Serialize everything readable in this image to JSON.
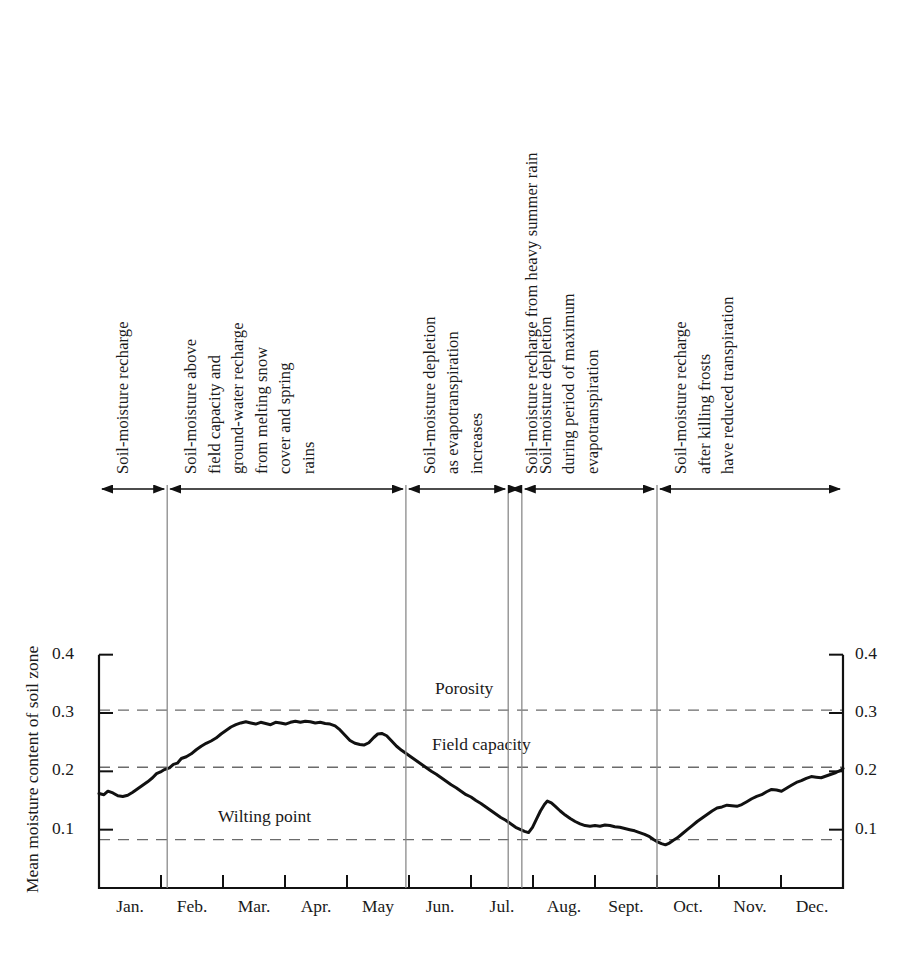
{
  "figure": {
    "background_color": "#ffffff",
    "line_color": "#111111",
    "dashed_color": "#6b6b6b",
    "divider_color": "#8a8a8a"
  },
  "axes": {
    "y_axis_title": "Mean moisture content of soil zone",
    "y_ticks": [
      "0.4",
      "0.3",
      "0.2",
      "0.1"
    ],
    "y_tick_values": [
      0.4,
      0.3,
      0.2,
      0.1
    ],
    "y_ticks_right": [
      "0.4",
      "0.3",
      "0.2",
      "0.1"
    ],
    "y_min": 0.0,
    "y_max": 0.42,
    "x_ticks": [
      "Jan.",
      "Feb.",
      "Mar.",
      "Apr.",
      "May",
      "Jun.",
      "Jul.",
      "Aug.",
      "Sept.",
      "Oct.",
      "Nov.",
      "Dec."
    ]
  },
  "reference_lines": [
    {
      "id": "porosity",
      "label": "Porosity",
      "value": 0.305
    },
    {
      "id": "field-capacity",
      "label": "Field capacity",
      "value": 0.207
    },
    {
      "id": "wilting-point",
      "label": "Wilting point",
      "value": 0.083
    }
  ],
  "annotations": [
    {
      "id": "recharge-winter",
      "lines": [
        "Soil-moisture recharge"
      ],
      "start_month": 0.0,
      "end_month": 1.1
    },
    {
      "id": "above-field-capacity",
      "lines": [
        "Soil-moisture above",
        "field capacity and",
        "ground-water recharge",
        "from melting snow",
        "cover and spring",
        "rains"
      ],
      "start_month": 1.1,
      "end_month": 4.95
    },
    {
      "id": "depletion-evapotranspiration",
      "lines": [
        "Soil-moisture depletion",
        "as evapotranspiration",
        "increases"
      ],
      "start_month": 4.95,
      "end_month": 6.6
    },
    {
      "id": "recharge-summer-rain",
      "lines": [
        "Soil-moisture recharge from heavy summer rain"
      ],
      "start_month": 6.6,
      "end_month": 6.82
    },
    {
      "id": "depletion-max-evapotranspiration",
      "lines": [
        "Soil-moisture depletion",
        "during period of maximum",
        "evapotranspiration"
      ],
      "start_month": 6.82,
      "end_month": 9.0
    },
    {
      "id": "recharge-after-frost",
      "lines": [
        "Soil-moisture recharge",
        "after killing frosts",
        "have reduced transpiration"
      ],
      "start_month": 9.0,
      "end_month": 12.0
    }
  ],
  "chart_data": {
    "type": "line",
    "title": "",
    "xlabel": "",
    "ylabel": "Mean moisture content of soil zone",
    "ylim": [
      0.0,
      0.42
    ],
    "xlim": [
      0,
      12
    ],
    "grid": false,
    "legend": "none",
    "categories": [
      "Jan.",
      "Feb.",
      "Mar.",
      "Apr.",
      "May",
      "Jun.",
      "Jul.",
      "Aug.",
      "Sept.",
      "Oct.",
      "Nov.",
      "Dec."
    ],
    "reference_values": {
      "porosity": 0.305,
      "field_capacity": 0.207,
      "wilting_point": 0.083
    },
    "series": [
      {
        "name": "Mean moisture content of soil zone",
        "x": [
          0.0,
          0.12,
          0.24,
          0.36,
          0.48,
          0.6,
          0.72,
          0.84,
          0.96,
          1.08,
          1.2,
          1.32,
          1.44,
          1.56,
          1.68,
          1.8,
          1.92,
          2.04,
          2.16,
          2.28,
          2.4,
          2.52,
          2.64,
          2.76,
          2.88,
          3.0,
          3.12,
          3.24,
          3.36,
          3.48,
          3.6,
          3.72,
          3.84,
          3.96,
          4.08,
          4.2,
          4.32,
          4.44,
          4.56,
          4.68,
          4.8,
          4.92,
          5.04,
          5.16,
          5.28,
          5.4,
          5.52,
          5.64,
          5.76,
          5.88,
          6.0,
          6.12,
          6.24,
          6.36,
          6.48,
          6.55,
          6.62,
          6.75,
          6.9,
          7.0,
          7.12,
          7.24,
          7.36,
          7.48,
          7.6,
          7.72,
          7.84,
          7.96,
          8.08,
          8.2,
          8.32,
          8.44,
          8.56,
          8.68,
          8.8,
          8.92,
          9.0,
          9.1,
          9.22,
          9.34,
          9.46,
          9.58,
          9.7,
          9.82,
          9.94,
          10.06,
          10.18,
          10.3,
          10.42,
          10.54,
          10.66,
          10.78,
          10.9,
          11.02,
          11.14,
          11.26,
          11.38,
          11.5,
          11.62,
          11.74,
          11.86,
          12.0
        ],
        "values": [
          0.162,
          0.16,
          0.166,
          0.162,
          0.158,
          0.157,
          0.16,
          0.166,
          0.172,
          0.178,
          0.185,
          0.191,
          0.196,
          0.2,
          0.205,
          0.207,
          0.212,
          0.213,
          0.222,
          0.226,
          0.23,
          0.237,
          0.243,
          0.247,
          0.252,
          0.257,
          0.264,
          0.27,
          0.275,
          0.279,
          0.282,
          0.284,
          0.283,
          0.281,
          0.283,
          0.282,
          0.28,
          0.284,
          0.283,
          0.281,
          0.283,
          0.286,
          0.284,
          0.286,
          0.285,
          0.283,
          0.282,
          0.282,
          0.281,
          0.279,
          0.272,
          0.264,
          0.255,
          0.249,
          0.246,
          0.245,
          0.247,
          0.258,
          0.265,
          0.263,
          0.259,
          0.25,
          0.243,
          0.238,
          0.231,
          0.226,
          0.221,
          0.215,
          0.209,
          0.203,
          0.199,
          0.193,
          0.188,
          0.181,
          0.176,
          0.172,
          0.168,
          0.162,
          0.157,
          0.152,
          0.149,
          0.143,
          0.138,
          0.133,
          0.128,
          0.124,
          0.119,
          0.112,
          0.107,
          0.101,
          0.098,
          0.096,
          0.095,
          0.099,
          0.112,
          0.126,
          0.138,
          0.146,
          0.15,
          0.148,
          0.143,
          0.136
        ]
      }
    ]
  },
  "curve_points": [
    [
      0.0,
      0.162
    ],
    [
      0.1,
      0.16
    ],
    [
      0.18,
      0.166
    ],
    [
      0.28,
      0.163
    ],
    [
      0.38,
      0.158
    ],
    [
      0.48,
      0.157
    ],
    [
      0.58,
      0.159
    ],
    [
      0.68,
      0.164
    ],
    [
      0.78,
      0.17
    ],
    [
      0.88,
      0.176
    ],
    [
      0.98,
      0.182
    ],
    [
      1.08,
      0.189
    ],
    [
      1.16,
      0.196
    ],
    [
      1.24,
      0.199
    ],
    [
      1.32,
      0.203
    ],
    [
      1.42,
      0.206
    ],
    [
      1.5,
      0.212
    ],
    [
      1.58,
      0.214
    ],
    [
      1.66,
      0.222
    ],
    [
      1.76,
      0.225
    ],
    [
      1.86,
      0.23
    ],
    [
      1.96,
      0.237
    ],
    [
      2.06,
      0.243
    ],
    [
      2.16,
      0.248
    ],
    [
      2.26,
      0.252
    ],
    [
      2.36,
      0.257
    ],
    [
      2.46,
      0.264
    ],
    [
      2.56,
      0.27
    ],
    [
      2.66,
      0.276
    ],
    [
      2.76,
      0.28
    ],
    [
      2.86,
      0.283
    ],
    [
      2.96,
      0.285
    ],
    [
      3.06,
      0.283
    ],
    [
      3.16,
      0.281
    ],
    [
      3.26,
      0.284
    ],
    [
      3.36,
      0.282
    ],
    [
      3.46,
      0.28
    ],
    [
      3.56,
      0.284
    ],
    [
      3.66,
      0.283
    ],
    [
      3.76,
      0.281
    ],
    [
      3.86,
      0.284
    ],
    [
      3.96,
      0.286
    ],
    [
      4.06,
      0.284
    ],
    [
      4.16,
      0.286
    ],
    [
      4.26,
      0.285
    ],
    [
      4.36,
      0.283
    ],
    [
      4.46,
      0.284
    ],
    [
      4.56,
      0.282
    ],
    [
      4.66,
      0.281
    ],
    [
      4.76,
      0.278
    ],
    [
      4.86,
      0.271
    ],
    [
      4.96,
      0.262
    ],
    [
      5.06,
      0.253
    ],
    [
      5.16,
      0.248
    ],
    [
      5.26,
      0.246
    ],
    [
      5.34,
      0.245
    ],
    [
      5.44,
      0.249
    ],
    [
      5.54,
      0.258
    ],
    [
      5.62,
      0.264
    ],
    [
      5.7,
      0.265
    ],
    [
      5.8,
      0.261
    ],
    [
      5.9,
      0.252
    ],
    [
      6.0,
      0.243
    ],
    [
      6.1,
      0.236
    ],
    [
      6.2,
      0.23
    ],
    [
      6.3,
      0.224
    ],
    [
      6.4,
      0.218
    ],
    [
      6.5,
      0.212
    ],
    [
      6.6,
      0.206
    ],
    [
      6.7,
      0.2
    ],
    [
      6.8,
      0.195
    ],
    [
      6.9,
      0.189
    ],
    [
      7.0,
      0.183
    ],
    [
      7.1,
      0.177
    ],
    [
      7.2,
      0.172
    ],
    [
      7.3,
      0.166
    ],
    [
      7.4,
      0.16
    ],
    [
      7.5,
      0.156
    ],
    [
      7.6,
      0.15
    ],
    [
      7.7,
      0.145
    ],
    [
      7.8,
      0.139
    ],
    [
      7.9,
      0.133
    ],
    [
      8.0,
      0.127
    ],
    [
      8.1,
      0.121
    ],
    [
      8.2,
      0.116
    ],
    [
      8.3,
      0.11
    ],
    [
      8.4,
      0.104
    ],
    [
      8.5,
      0.1
    ],
    [
      8.58,
      0.097
    ],
    [
      8.66,
      0.095
    ],
    [
      8.74,
      0.104
    ],
    [
      8.82,
      0.118
    ],
    [
      8.9,
      0.132
    ],
    [
      8.98,
      0.143
    ],
    [
      9.04,
      0.149
    ],
    [
      9.12,
      0.146
    ],
    [
      9.2,
      0.14
    ],
    [
      9.3,
      0.132
    ],
    [
      9.4,
      0.125
    ],
    [
      9.5,
      0.119
    ],
    [
      9.6,
      0.114
    ],
    [
      9.7,
      0.11
    ],
    [
      9.8,
      0.107
    ],
    [
      9.9,
      0.106
    ],
    [
      10.0,
      0.107
    ],
    [
      10.1,
      0.106
    ],
    [
      10.2,
      0.108
    ],
    [
      10.3,
      0.107
    ],
    [
      10.4,
      0.105
    ],
    [
      10.5,
      0.104
    ],
    [
      10.6,
      0.102
    ],
    [
      10.7,
      0.1
    ],
    [
      10.8,
      0.098
    ],
    [
      10.9,
      0.095
    ],
    [
      11.0,
      0.092
    ],
    [
      11.1,
      0.088
    ],
    [
      11.18,
      0.083
    ],
    [
      11.26,
      0.079
    ],
    [
      11.34,
      0.076
    ],
    [
      11.42,
      0.074
    ],
    [
      11.5,
      0.077
    ],
    [
      11.58,
      0.082
    ],
    [
      11.66,
      0.086
    ],
    [
      11.76,
      0.093
    ],
    [
      11.86,
      0.1
    ],
    [
      11.96,
      0.107
    ],
    [
      12.06,
      0.114
    ],
    [
      12.16,
      0.12
    ],
    [
      12.26,
      0.126
    ],
    [
      12.36,
      0.132
    ],
    [
      12.46,
      0.137
    ],
    [
      12.56,
      0.139
    ],
    [
      12.66,
      0.142
    ],
    [
      12.76,
      0.141
    ],
    [
      12.86,
      0.14
    ],
    [
      12.96,
      0.143
    ],
    [
      13.06,
      0.148
    ],
    [
      13.16,
      0.153
    ],
    [
      13.26,
      0.157
    ],
    [
      13.36,
      0.16
    ],
    [
      13.46,
      0.165
    ],
    [
      13.56,
      0.169
    ],
    [
      13.66,
      0.168
    ],
    [
      13.76,
      0.166
    ],
    [
      13.86,
      0.171
    ],
    [
      13.96,
      0.176
    ],
    [
      14.06,
      0.181
    ],
    [
      14.16,
      0.184
    ],
    [
      14.26,
      0.188
    ],
    [
      14.36,
      0.191
    ],
    [
      14.46,
      0.19
    ],
    [
      14.56,
      0.189
    ],
    [
      14.66,
      0.192
    ],
    [
      14.76,
      0.195
    ],
    [
      14.86,
      0.198
    ],
    [
      14.96,
      0.202
    ],
    [
      15.0,
      0.205
    ]
  ]
}
